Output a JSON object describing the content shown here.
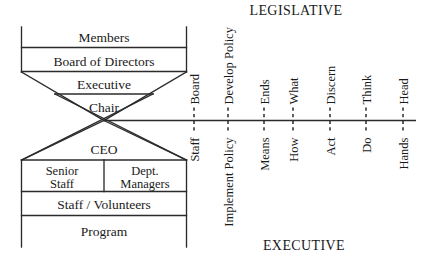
{
  "figure": {
    "title_top": "LEGISLATIVE",
    "title_bottom": "EXECUTIVE"
  },
  "org_chart": {
    "upper_levels": [
      {
        "label": "Members"
      },
      {
        "label": "Board of Directors"
      },
      {
        "label": "Executive"
      },
      {
        "label": "Chair"
      }
    ],
    "lower_levels": [
      {
        "label": "CEO"
      },
      {
        "label": "Senior Staff"
      },
      {
        "label": "Dept. Managers"
      },
      {
        "label": "Staff / Volunteers"
      },
      {
        "label": "Program"
      }
    ]
  },
  "axis": {
    "ticks": [
      {
        "x": 194,
        "above": "Board",
        "below": "Staff"
      },
      {
        "x": 228,
        "above": "Develop Policy",
        "below": "Implement Policy"
      },
      {
        "x": 264,
        "above": "Ends",
        "below": "Means"
      },
      {
        "x": 293,
        "above": "What",
        "below": "How"
      },
      {
        "x": 330,
        "above": "Discern",
        "below": "Act"
      },
      {
        "x": 366,
        "above": "Think",
        "below": "Do"
      },
      {
        "x": 403,
        "above": "Head",
        "below": "Hands"
      }
    ]
  },
  "colors": {
    "ink": "#2b2b2b",
    "text": "#1a1a1a",
    "background": "#ffffff"
  }
}
